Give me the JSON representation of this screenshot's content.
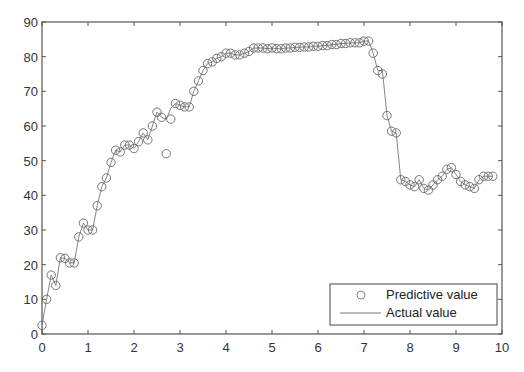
{
  "chart_data": {
    "type": "line",
    "title": "",
    "xlabel": "",
    "ylabel": "",
    "xlim": [
      0,
      10
    ],
    "ylim": [
      0,
      90
    ],
    "grid": false,
    "legend_position": "lower right",
    "x_ticks": [
      "0",
      "1",
      "2",
      "3",
      "4",
      "5",
      "6",
      "7",
      "8",
      "9",
      "10"
    ],
    "y_ticks": [
      "0",
      "10",
      "20",
      "30",
      "40",
      "50",
      "60",
      "70",
      "80",
      "90"
    ],
    "legend": {
      "entries": [
        {
          "label": "Predictive value",
          "marker": "circle"
        },
        {
          "label": "Actual value",
          "marker": "line"
        }
      ]
    },
    "x": [
      0,
      0.1,
      0.2,
      0.3,
      0.4,
      0.5,
      0.6,
      0.7,
      0.8,
      0.9,
      1.0,
      1.1,
      1.2,
      1.3,
      1.4,
      1.5,
      1.6,
      1.7,
      1.8,
      1.9,
      2.0,
      2.1,
      2.2,
      2.3,
      2.4,
      2.5,
      2.6,
      2.7,
      2.8,
      2.9,
      3.0,
      3.1,
      3.2,
      3.3,
      3.4,
      3.5,
      3.6,
      3.7,
      3.8,
      3.9,
      4.0,
      4.1,
      4.2,
      4.3,
      4.4,
      4.5,
      4.6,
      4.7,
      4.8,
      4.9,
      5.0,
      5.1,
      5.2,
      5.3,
      5.4,
      5.5,
      5.6,
      5.7,
      5.8,
      5.9,
      6.0,
      6.1,
      6.2,
      6.3,
      6.4,
      6.5,
      6.6,
      6.7,
      6.8,
      6.9,
      7.0,
      7.1,
      7.2,
      7.3,
      7.4,
      7.5,
      7.6,
      7.7,
      7.8,
      7.9,
      8.0,
      8.1,
      8.2,
      8.3,
      8.4,
      8.5,
      8.6,
      8.7,
      8.8,
      8.9,
      9.0,
      9.1,
      9.2,
      9.3,
      9.4,
      9.5,
      9.6,
      9.7,
      9.8
    ],
    "series": [
      {
        "name": "Actual value",
        "style": "line",
        "values": [
          2.5,
          10,
          17,
          14,
          22,
          21.8,
          20.5,
          20.5,
          28,
          32,
          30,
          30,
          37,
          42.5,
          45,
          49.5,
          53,
          52.5,
          54.5,
          54.5,
          53.5,
          55.5,
          58,
          56,
          60,
          64,
          62.5,
          62,
          65,
          66.5,
          66,
          65.5,
          65.5,
          70,
          73,
          76,
          78,
          78.5,
          79.5,
          80,
          81,
          81,
          80.5,
          80.5,
          81,
          81.5,
          82.5,
          82.5,
          82.5,
          82.3,
          82.5,
          82.3,
          82.3,
          82.5,
          82.5,
          82.7,
          82.7,
          82.8,
          82.8,
          83,
          83,
          83.2,
          83.2,
          83.5,
          83.5,
          83.8,
          83.8,
          84,
          84,
          84,
          84.5,
          84.5,
          81,
          76,
          76,
          63,
          58.5,
          58,
          44.5,
          44,
          43,
          42.5,
          44.5,
          42,
          41.5,
          43,
          44.5,
          45.5,
          47.5,
          48,
          46,
          44,
          43,
          42.5,
          42,
          44.5,
          45.5,
          45.5,
          45.5
        ]
      },
      {
        "name": "Predictive value",
        "style": "circle",
        "values": [
          2.5,
          10,
          17,
          14,
          22,
          21.8,
          20.5,
          20.5,
          28,
          32,
          30,
          30,
          37,
          42.5,
          45,
          49.5,
          53,
          52.5,
          54.5,
          54.5,
          53.5,
          55.5,
          58,
          56,
          60,
          64,
          62.5,
          52,
          62,
          66.5,
          66,
          65.5,
          65.5,
          70,
          73,
          76,
          78,
          78.5,
          79.5,
          80,
          81,
          81,
          80.5,
          80.5,
          81,
          81.5,
          82.5,
          82.5,
          82.5,
          82.3,
          82.5,
          82.3,
          82.3,
          82.5,
          82.5,
          82.7,
          82.7,
          82.8,
          82.8,
          83,
          83,
          83.2,
          83.2,
          83.5,
          83.5,
          83.8,
          83.8,
          84,
          84,
          84,
          84.5,
          84.5,
          81,
          76,
          75,
          63,
          58.5,
          58,
          44.5,
          44,
          43,
          42.5,
          44.5,
          42,
          41.5,
          43,
          44.5,
          45.5,
          47.5,
          48,
          46,
          44,
          43,
          42.5,
          42,
          44.5,
          45.5,
          45.5,
          45.5
        ]
      }
    ]
  },
  "colors": {
    "axis": "#555555",
    "line": "#777777",
    "marker": "#666666"
  }
}
